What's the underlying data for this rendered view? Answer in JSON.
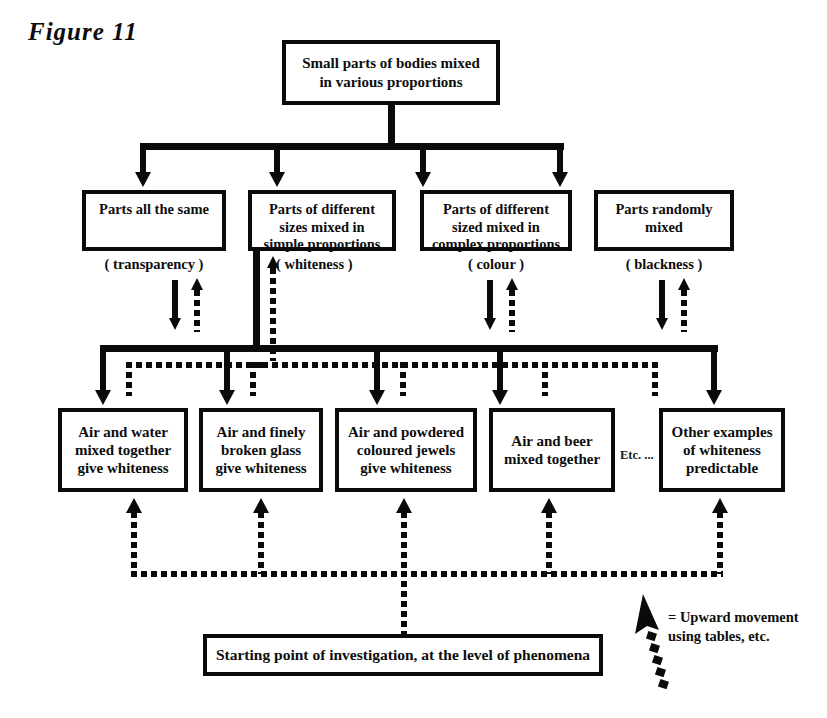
{
  "figure": {
    "label": "Figure 11"
  },
  "nodes": {
    "top": {
      "id": "small-parts-of-bodies",
      "text": "Small parts of bodies mixed\nin various proportions"
    },
    "row2": [
      {
        "id": "parts-all-the-same",
        "text": "Parts all the same",
        "paren": "( transparency )"
      },
      {
        "id": "parts-simple-proportions",
        "text": "Parts of different\nsizes mixed in\nsimple proportions",
        "paren": "( whiteness )"
      },
      {
        "id": "parts-complex-proportions",
        "text": "Parts of different\nsized mixed in\ncomplex proportions",
        "paren": "( colour )"
      },
      {
        "id": "parts-randomly-mixed",
        "text": "Parts randomly\nmixed",
        "paren": "( blackness )"
      }
    ],
    "row3": [
      {
        "id": "air-and-water",
        "text": "Air and water\nmixed together\ngive whiteness"
      },
      {
        "id": "air-and-glass",
        "text": "Air and finely\nbroken glass\ngive whiteness"
      },
      {
        "id": "air-and-jewels",
        "text": "Air and powdered\ncoloured jewels\ngive whiteness"
      },
      {
        "id": "air-and-beer",
        "text": "Air and beer\nmixed together"
      },
      {
        "id": "other-examples",
        "text": "Other examples\nof whiteness\npredictable"
      }
    ],
    "etc_note": "Etc. ...",
    "bottom": {
      "id": "starting-point",
      "text": "Starting point of investigation, at the level of phenomena"
    }
  },
  "legend": {
    "equals_text": "= Upward movement\n     using tables, etc.",
    "arrow_name": "dashed-upward-arrow"
  },
  "colors": {
    "ink": "#0a0a0a",
    "paper": "#ffffff"
  }
}
